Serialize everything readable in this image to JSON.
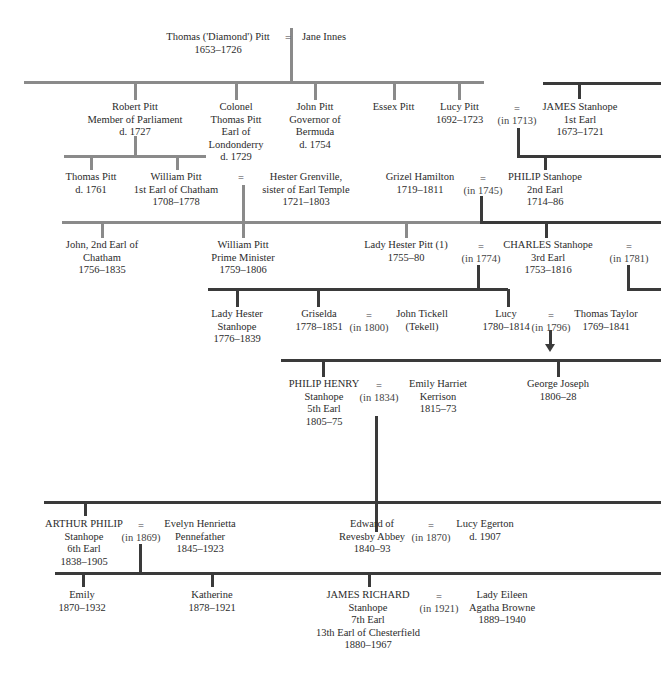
{
  "colors": {
    "pitt_line": "#8a8a8a",
    "stanhope_line": "#3a3a3a",
    "text": "#2b2b2b"
  },
  "people": {
    "thomas_diamond": [
      "Thomas ('Diamond') Pitt",
      "1653–1726"
    ],
    "jane_innes": [
      "Jane Innes"
    ],
    "robert_pitt": [
      "Robert Pitt",
      "Member of Parliament",
      "d. 1727"
    ],
    "colonel_thomas": [
      "Colonel",
      "Thomas Pitt",
      "Earl of",
      "Londonderry",
      "d. 1729"
    ],
    "john_pitt": [
      "John Pitt",
      "Governor of",
      "Bermuda",
      "d. 1754"
    ],
    "essex_pitt": [
      "Essex Pitt"
    ],
    "lucy_pitt": [
      "Lucy Pitt",
      "1692–1723"
    ],
    "james_stanhope": [
      "JAMES Stanhope",
      "1st Earl",
      "1673–1721"
    ],
    "thomas_pitt_1761": [
      "Thomas Pitt",
      "d. 1761"
    ],
    "william_pitt_chatham": [
      "William Pitt",
      "1st Earl of Chatham",
      "1708–1778"
    ],
    "hester_grenville": [
      "Hester Grenville,",
      "sister of Earl Temple",
      "1721–1803"
    ],
    "grizel_hamilton": [
      "Grizel Hamilton",
      "1719–1811"
    ],
    "philip_stanhope": [
      "PHILIP Stanhope",
      "2nd Earl",
      "1714–86"
    ],
    "john_chatham": [
      "John, 2nd Earl of",
      "Chatham",
      "1756–1835"
    ],
    "william_pitt_pm": [
      "William Pitt",
      "Prime Minister",
      "1759–1806"
    ],
    "lady_hester_pitt": [
      "Lady Hester Pitt (1)",
      "1755–80"
    ],
    "charles_stanhope": [
      "CHARLES Stanhope",
      "3rd Earl",
      "1753–1816"
    ],
    "lady_hester_stanhope": [
      "Lady Hester",
      "Stanhope",
      "1776–1839"
    ],
    "griselda": [
      "Griselda",
      "1778–1851"
    ],
    "john_tickell": [
      "John Tickell",
      "(Tekell)"
    ],
    "lucy": [
      "Lucy",
      "1780–1814"
    ],
    "thomas_taylor": [
      "Thomas Taylor",
      "1769–1841"
    ],
    "philip_henry": [
      "PHILIP HENRY",
      "Stanhope",
      "5th Earl",
      "1805–75"
    ],
    "emily_kerrison": [
      "Emily Harriet",
      "Kerrison",
      "1815–73"
    ],
    "george_joseph": [
      "George Joseph",
      "1806–28"
    ],
    "arthur_philip": [
      "ARTHUR PHILIP",
      "Stanhope",
      "6th Earl",
      "1838–1905"
    ],
    "evelyn_pennefather": [
      "Evelyn Henrietta",
      "Pennefather",
      "1845–1923"
    ],
    "edward_revesby": [
      "Edward of",
      "Revesby Abbey",
      "1840–93"
    ],
    "lucy_egerton": [
      "Lucy Egerton",
      "d. 1907"
    ],
    "emily": [
      "Emily",
      "1870–1932"
    ],
    "katherine": [
      "Katherine",
      "1878–1921"
    ],
    "james_richard": [
      "JAMES RICHARD",
      "Stanhope",
      "7th Earl",
      "13th Earl of Chesterfield",
      "1880–1967"
    ],
    "lady_eileen": [
      "Lady Eileen",
      "Agatha Browne",
      "1889–1940"
    ]
  },
  "marriages": {
    "m_diamond": [
      "="
    ],
    "m_1713": [
      "=",
      "(in 1713)"
    ],
    "m_chatham": [
      "="
    ],
    "m_1745": [
      "=",
      "(in 1745)"
    ],
    "m_1774": [
      "=",
      "(in 1774)"
    ],
    "m_1781": [
      "=",
      "(in 1781)"
    ],
    "m_1800": [
      "=",
      "(in 1800)"
    ],
    "m_1796": [
      "=",
      "(in 1796)"
    ],
    "m_1834": [
      "=",
      "(in 1834)"
    ],
    "m_1869": [
      "=",
      "(in 1869)"
    ],
    "m_1870": [
      "=",
      "(in 1870)"
    ],
    "m_1921": [
      "=",
      "(in 1921)"
    ]
  }
}
